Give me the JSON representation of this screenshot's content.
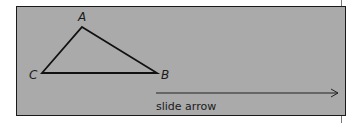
{
  "diagram": {
    "background_color": "#aaaaaa",
    "triangle": {
      "vertices": [
        {
          "label": "A",
          "x": 82,
          "y": 27
        },
        {
          "label": "B",
          "x": 157,
          "y": 73
        },
        {
          "label": "C",
          "x": 42,
          "y": 73
        }
      ]
    },
    "arrow": {
      "x1": 156,
      "y1": 93,
      "x2": 338,
      "y2": 93,
      "caption": "slide arrow"
    }
  }
}
